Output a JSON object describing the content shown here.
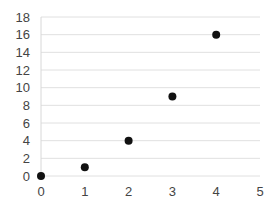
{
  "chart_data": {
    "type": "scatter",
    "title": "",
    "xlabel": "",
    "ylabel": "",
    "x": [
      0,
      1,
      2,
      3,
      4
    ],
    "y": [
      0,
      1,
      4,
      9,
      16
    ],
    "series": [
      {
        "name": "",
        "x": [
          0,
          1,
          2,
          3,
          4
        ],
        "values": [
          0,
          1,
          4,
          9,
          16
        ],
        "color": "#111111"
      }
    ],
    "xlim": [
      0,
      5
    ],
    "ylim": [
      0,
      18
    ],
    "x_ticks": [
      "0",
      "1",
      "2",
      "3",
      "4",
      "5"
    ],
    "y_ticks": [
      "0",
      "2",
      "4",
      "6",
      "8",
      "10",
      "12",
      "14",
      "16",
      "18"
    ],
    "grid": {
      "horizontal": true,
      "vertical": false,
      "color": "#e0e0e0"
    },
    "legend": "none"
  }
}
